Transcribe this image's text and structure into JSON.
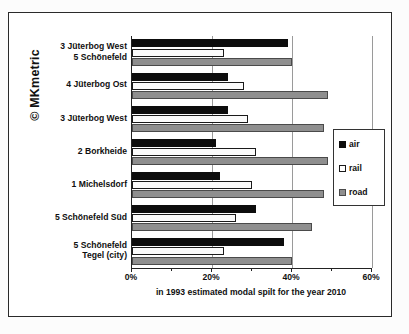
{
  "copyright": "© MKmetric",
  "chart_data": {
    "type": "bar",
    "orientation": "horizontal",
    "title": "",
    "xlabel": "in 1993 estimated modal spilt for the year 2010",
    "ylabel": "",
    "xlim": [
      0,
      60
    ],
    "xticks": [
      0,
      20,
      40,
      60
    ],
    "xticklabels": [
      "0%",
      "20%",
      "40%",
      "60%"
    ],
    "grid": true,
    "legend_position": "right",
    "categories": [
      "3 Jüterbog West\n5 Schönefeld",
      "4 Jüterbog Ost",
      "3 Jüterbog West",
      "2 Borkheide",
      "1 Michelsdorf",
      "5 Schönefeld Süd",
      "5 Schönefeld\nTegel (city)"
    ],
    "category_lines": [
      [
        "3 Jüterbog West",
        "5 Schönefeld"
      ],
      [
        "4 Jüterbog Ost"
      ],
      [
        "3 Jüterbog West"
      ],
      [
        "2 Borkheide"
      ],
      [
        "1 Michelsdorf"
      ],
      [
        "5 Schönefeld Süd"
      ],
      [
        "5 Schönefeld",
        "Tegel (city)"
      ]
    ],
    "series": [
      {
        "name": "air",
        "color": "#0d0d0d",
        "values": [
          39,
          24,
          24,
          21,
          22,
          31,
          38
        ]
      },
      {
        "name": "rail",
        "color": "#ffffff",
        "values": [
          23,
          28,
          29,
          31,
          30,
          26,
          23
        ]
      },
      {
        "name": "road",
        "color": "#8f8f8f",
        "values": [
          40,
          49,
          48,
          49,
          48,
          45,
          40
        ]
      }
    ]
  },
  "legend": {
    "items": [
      {
        "label": "air",
        "swatch": "air-swatch"
      },
      {
        "label": "rail",
        "swatch": "rail-swatch"
      },
      {
        "label": "road",
        "swatch": "road-swatch"
      }
    ]
  }
}
